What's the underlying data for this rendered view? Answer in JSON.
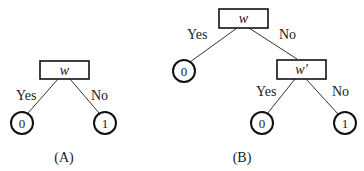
{
  "diagrams": {
    "A": {
      "caption": "(A)",
      "root": {
        "label": "w"
      },
      "edges": {
        "yes": "Yes",
        "no": "No"
      },
      "leaves": {
        "yes": "0",
        "no": "1"
      }
    },
    "B": {
      "caption": "(B)",
      "root": {
        "label": "w"
      },
      "root_edges": {
        "yes": "Yes",
        "no": "No"
      },
      "root_yes_leaf": "0",
      "child": {
        "label": "w′"
      },
      "child_edges": {
        "yes": "Yes",
        "no": "No"
      },
      "child_leaves": {
        "yes": "0",
        "no": "1"
      }
    }
  },
  "colors": {
    "stroke": "#111111",
    "background": "#ffffff"
  }
}
